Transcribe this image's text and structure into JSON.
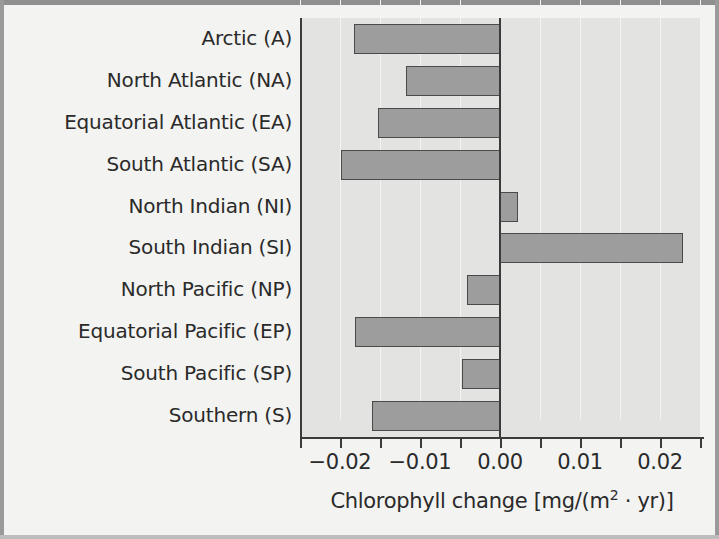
{
  "chart_data": {
    "type": "bar",
    "orientation": "horizontal",
    "title": "",
    "xlabel": "Chlorophyll change [mg/(m2 · yr)]",
    "ylabel": "",
    "categories": [
      "Arctic (A)",
      "North Atlantic (NA)",
      "Equatorial Atlantic (EA)",
      "South Atlantic (SA)",
      "North Indian (NI)",
      "South Indian (SI)",
      "North Pacific (NP)",
      "Equatorial Pacific (EP)",
      "South Pacific (SP)",
      "Southern (S)"
    ],
    "values": [
      -0.0183,
      -0.0118,
      -0.0153,
      -0.0199,
      0.0023,
      0.0229,
      -0.0041,
      -0.0181,
      -0.0048,
      -0.016
    ],
    "xlim": [
      -0.025,
      0.025
    ],
    "xticks": [
      -0.02,
      -0.01,
      0.0,
      0.01,
      0.02
    ],
    "xtick_labels": [
      "−0.02",
      "−0.01",
      "0.00",
      "0.01",
      "0.02"
    ],
    "xminor_ticks": [
      -0.025,
      -0.015,
      -0.005,
      0.005,
      0.015,
      0.025
    ],
    "grid": "vertical-minor",
    "legend": null,
    "bar_fill_color": "#9d9d9d",
    "bar_edge_color": "#4a4a4a",
    "plot_background_color": "#e3e3e1",
    "axis_color": "#3b3b3b"
  },
  "axis_title": {
    "prefix": "Chlorophyll change [mg/(m",
    "exponent": "2",
    "suffix": " · yr)]"
  }
}
